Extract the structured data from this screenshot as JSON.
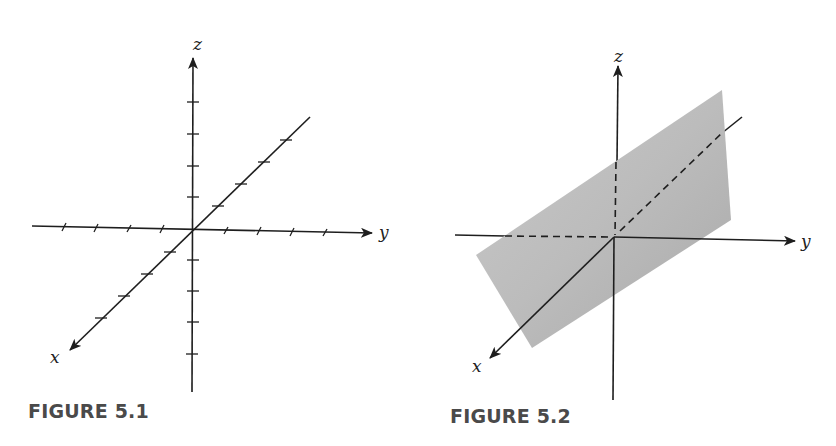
{
  "figures": [
    {
      "caption": "FIGURE 5.1",
      "axes": {
        "x_label": "x",
        "y_label": "y",
        "z_label": "z"
      },
      "description": "3D coordinate axes with tick marks",
      "ticks_per_half_axis": 4
    },
    {
      "caption": "FIGURE 5.2",
      "axes": {
        "x_label": "x",
        "y_label": "y",
        "z_label": "z"
      },
      "description": "Plane in 3D space with axes hidden behind plane drawn dashed",
      "plane_color": "#bdbdbd"
    }
  ],
  "colors": {
    "line": "#1e1e1e",
    "caption": "#4a4a4a",
    "plane": "#bdbdbd"
  }
}
